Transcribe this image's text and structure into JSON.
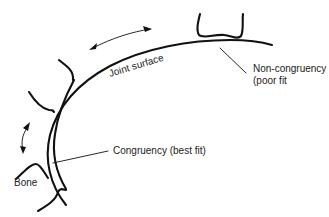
{
  "diagram": {
    "labels": {
      "joint_surface": "Joint surface",
      "non_congruency_line1": "Non-congruency",
      "non_congruency_line2": "(poor fit",
      "congruency": "Congruency (best fit)",
      "bone": "Bone"
    },
    "colors": {
      "line": "#111111",
      "text": "#222222",
      "background": "#ffffff"
    }
  }
}
